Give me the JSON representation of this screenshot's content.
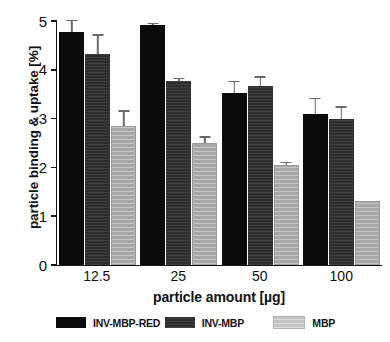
{
  "chart_data": {
    "type": "bar",
    "title": "",
    "xlabel": "particle amount [µg]",
    "ylabel": "particle binding & uptake [%]",
    "categories": [
      "12.5",
      "25",
      "50",
      "100"
    ],
    "ylim": [
      0,
      5
    ],
    "yticks": [
      0,
      1,
      2,
      3,
      4,
      5
    ],
    "ytick_labels": [
      "0",
      "1",
      "2",
      "3",
      "4",
      "5"
    ],
    "grid": false,
    "legend_position": "bottom",
    "series": [
      {
        "name": "INV-MBP-RED",
        "color": "#0b0b0b",
        "values": [
          4.78,
          4.92,
          3.52,
          3.1
        ],
        "errors": [
          0.24,
          0.04,
          0.26,
          0.33
        ]
      },
      {
        "name": "INV-MBP",
        "color": "#2e2e2e",
        "values": [
          4.33,
          3.78,
          3.67,
          2.99
        ],
        "errors": [
          0.4,
          0.06,
          0.2,
          0.26
        ]
      },
      {
        "name": "MBP",
        "color": "#a8a8a8",
        "values": [
          2.84,
          2.5,
          2.05,
          1.32
        ],
        "errors": [
          0.33,
          0.14,
          0.07,
          0.0
        ]
      }
    ]
  },
  "legend": {
    "items": [
      {
        "label": "INV-MBP-RED"
      },
      {
        "label": "INV-MBP"
      },
      {
        "label": "MBP"
      }
    ]
  }
}
